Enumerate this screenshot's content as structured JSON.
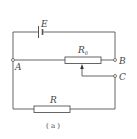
{
  "diagram": {
    "type": "circuit",
    "labels": {
      "battery": "E",
      "rheostat": "R",
      "rheostat_sub": "0",
      "resistor": "R",
      "node_a": "A",
      "node_b": "B",
      "node_c": "C",
      "caption": "( a )"
    },
    "colors": {
      "line": "#555555",
      "text": "#444444",
      "background": "#ffffff"
    }
  }
}
